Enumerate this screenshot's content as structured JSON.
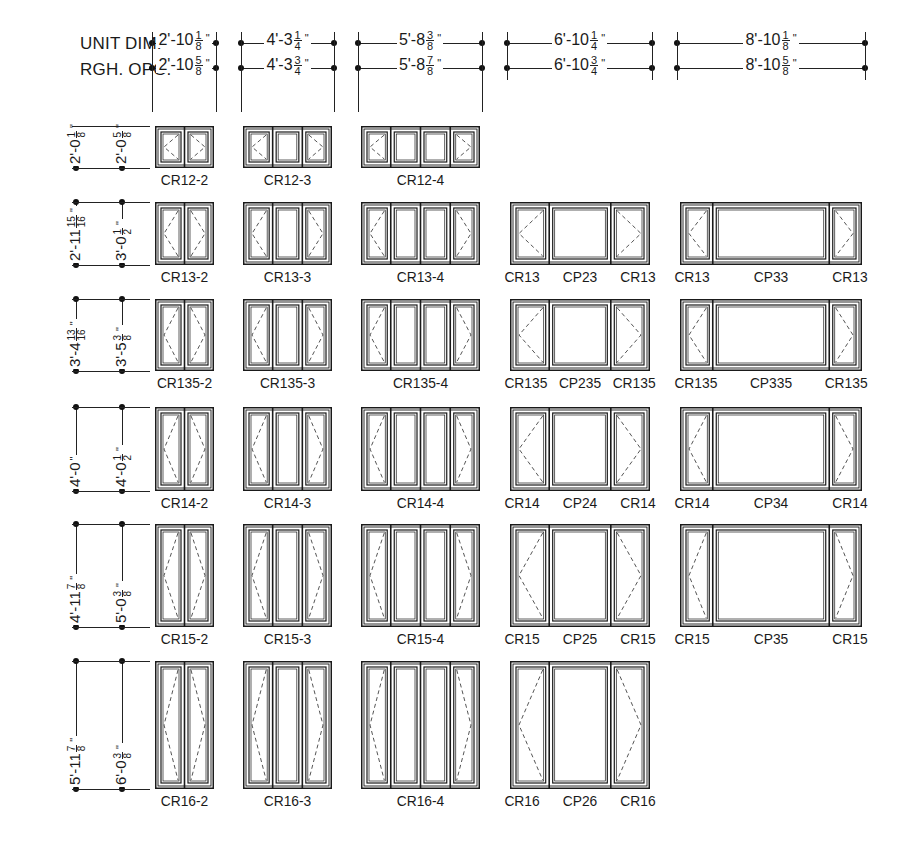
{
  "header": {
    "unit_dim_label": "UNIT DIM.",
    "rough_opening_label": "RGH. OPG."
  },
  "columns": [
    {
      "unit": {
        "whole": "2'-10",
        "num": "1",
        "den": "8"
      },
      "rough": {
        "whole": "2'-10",
        "num": "5",
        "den": "8"
      }
    },
    {
      "unit": {
        "whole": "4'-3",
        "num": "1",
        "den": "4"
      },
      "rough": {
        "whole": "4'-3",
        "num": "3",
        "den": "4"
      }
    },
    {
      "unit": {
        "whole": "5'-8",
        "num": "3",
        "den": "8"
      },
      "rough": {
        "whole": "5'-8",
        "num": "7",
        "den": "8"
      }
    },
    {
      "unit": {
        "whole": "6'-10",
        "num": "1",
        "den": "4"
      },
      "rough": {
        "whole": "6'-10",
        "num": "3",
        "den": "4"
      }
    },
    {
      "unit": {
        "whole": "8'-10",
        "num": "1",
        "den": "8"
      },
      "rough": {
        "whole": "8'-10",
        "num": "5",
        "den": "8"
      }
    }
  ],
  "inch_mark": "\"",
  "rows": [
    {
      "unit": {
        "whole": "2'-0",
        "num": "1",
        "den": "8"
      },
      "rough": {
        "whole": "2'-0",
        "num": "5",
        "den": "8"
      },
      "labels": [
        "CR12-2",
        "CR12-3",
        "CR12-4"
      ],
      "combos": []
    },
    {
      "unit": {
        "whole": "2'-11",
        "num": "15",
        "den": "16"
      },
      "rough": {
        "whole": "3'-0",
        "num": "1",
        "den": "2"
      },
      "labels": [
        "CR13-2",
        "CR13-3",
        "CR13-4"
      ],
      "combos": [
        [
          "CR13",
          "CP23",
          "CR13"
        ],
        [
          "CR13",
          "CP33",
          "CR13"
        ]
      ]
    },
    {
      "unit": {
        "whole": "3'-4",
        "num": "13",
        "den": "16"
      },
      "rough": {
        "whole": "3'-5",
        "num": "3",
        "den": "8"
      },
      "labels": [
        "CR135-2",
        "CR135-3",
        "CR135-4"
      ],
      "combos": [
        [
          "CR135",
          "CP235",
          "CR135"
        ],
        [
          "CR135",
          "CP335",
          "CR135"
        ]
      ]
    },
    {
      "unit": {
        "whole": "4'-0",
        "num": "",
        "den": ""
      },
      "rough": {
        "whole": "4'-0",
        "num": "1",
        "den": "2"
      },
      "labels": [
        "CR14-2",
        "CR14-3",
        "CR14-4"
      ],
      "combos": [
        [
          "CR14",
          "CP24",
          "CR14"
        ],
        [
          "CR14",
          "CP34",
          "CR14"
        ]
      ]
    },
    {
      "unit": {
        "whole": "4'-11",
        "num": "7",
        "den": "8"
      },
      "rough": {
        "whole": "5'-0",
        "num": "3",
        "den": "8"
      },
      "labels": [
        "CR15-2",
        "CR15-3",
        "CR15-4"
      ],
      "combos": [
        [
          "CR15",
          "CP25",
          "CR15"
        ],
        [
          "CR15",
          "CP35",
          "CR15"
        ]
      ]
    },
    {
      "unit": {
        "whole": "5'-11",
        "num": "7",
        "den": "8"
      },
      "rough": {
        "whole": "6'-0",
        "num": "3",
        "den": "8"
      },
      "labels": [
        "CR16-2",
        "CR16-3",
        "CR16-4"
      ],
      "combos": [
        [
          "CR16",
          "CP26",
          "CR16"
        ]
      ]
    }
  ],
  "colors": {
    "ink": "#1a1a1a",
    "dash": "#555555",
    "paper": "#ffffff"
  }
}
